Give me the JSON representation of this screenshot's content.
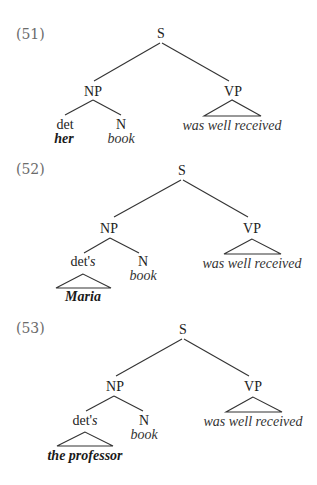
{
  "examples": [
    {
      "number": "(51)",
      "root": "S",
      "np": "NP",
      "vp": "VP",
      "det_label": "det",
      "det_suffix": "",
      "det_filler": "her",
      "det_filler_triangle": false,
      "n_label": "N",
      "n_word": "book",
      "vp_words": "was well received"
    },
    {
      "number": "(52)",
      "root": "S",
      "np": "NP",
      "vp": "VP",
      "det_label": "det'",
      "det_suffix": "s",
      "det_filler": "Maria",
      "det_filler_triangle": true,
      "n_label": "N",
      "n_word": "book",
      "vp_words": "was well received"
    },
    {
      "number": "(53)",
      "root": "S",
      "np": "NP",
      "vp": "VP",
      "det_label": "det'",
      "det_suffix": "s",
      "det_filler": "the professor",
      "det_filler_triangle": true,
      "n_label": "N",
      "n_word": "book",
      "vp_words": "was well received"
    }
  ]
}
